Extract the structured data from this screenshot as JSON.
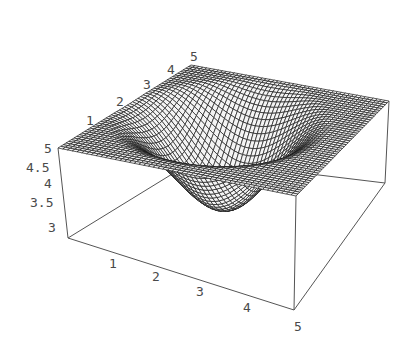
{
  "chart_data": {
    "type": "surface3d",
    "title": "",
    "xlabel": "",
    "ylabel": "",
    "zlabel": "",
    "x_range": [
      0,
      5
    ],
    "y_range": [
      0,
      5
    ],
    "z_range": [
      3,
      5
    ],
    "x_ticks": [
      "1",
      "2",
      "3",
      "4",
      "5"
    ],
    "y_ticks": [
      "1",
      "2",
      "3",
      "4",
      "5"
    ],
    "z_ticks": [
      "3",
      "3.5",
      "4",
      "4.5",
      "5"
    ],
    "surface": {
      "description": "Flat plane at z=5 with a smooth bowl-shaped depression reaching about z=3.2",
      "base_level": 5,
      "min_level": 3.2,
      "depression_center": [
        2.2,
        2.6
      ],
      "depression_radius": 2.3,
      "grid_lines": 50
    },
    "boxed": true,
    "grid": false,
    "legend": null
  },
  "projection": {
    "top": {
      "x0y0": [
        58,
        148
      ],
      "x5y0": [
        296,
        196
      ],
      "x0y5": [
        191,
        65
      ],
      "x5y5": [
        389,
        101
      ]
    },
    "bottom": {
      "x0y0": [
        68,
        238
      ],
      "x5y0": [
        294,
        310
      ],
      "x0y5": [
        195,
        160
      ],
      "x5y5": [
        385,
        183
      ]
    }
  },
  "labels": {
    "x_axis": [
      {
        "text": "1",
        "pos": [
          109,
          268
        ]
      },
      {
        "text": "2",
        "pos": [
          152,
          281
        ]
      },
      {
        "text": "3",
        "pos": [
          196,
          296
        ]
      },
      {
        "text": "4",
        "pos": [
          243,
          312
        ]
      },
      {
        "text": "5",
        "pos": [
          294,
          331
        ]
      }
    ],
    "y_axis": [
      {
        "text": "1",
        "pos": [
          86,
          125
        ]
      },
      {
        "text": "2",
        "pos": [
          116,
          106
        ]
      },
      {
        "text": "3",
        "pos": [
          143,
          89
        ]
      },
      {
        "text": "4",
        "pos": [
          167,
          74
        ]
      },
      {
        "text": "5",
        "pos": [
          190,
          61
        ]
      }
    ],
    "z_axis": [
      {
        "text": "5",
        "pos": [
          44,
          153
        ]
      },
      {
        "text": "4.5",
        "pos": [
          26,
          172
        ]
      },
      {
        "text": "4",
        "pos": [
          44,
          188
        ]
      },
      {
        "text": "3.5",
        "pos": [
          30,
          207
        ]
      },
      {
        "text": "3",
        "pos": [
          48,
          232
        ]
      }
    ]
  },
  "colors": {
    "mesh": "#1a1a1a",
    "box": "#555555",
    "label": "#4a4a4a",
    "background": "#ffffff"
  }
}
